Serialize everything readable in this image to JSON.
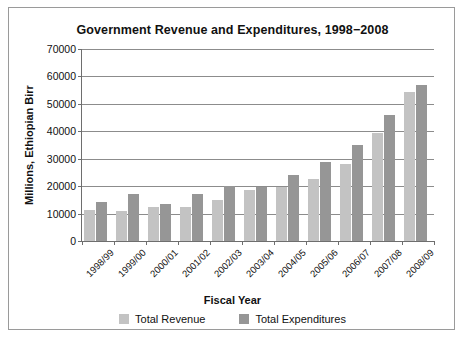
{
  "chart_data": {
    "type": "bar",
    "title": "Government Revenue and Expenditures, 1998−2008",
    "xlabel": "Fiscal Year",
    "ylabel": "Millions, Ethiopian Birr",
    "ylim": [
      0,
      70000
    ],
    "ytick_labels": [
      "70000",
      "60000",
      "50000",
      "40000",
      "30000",
      "20000",
      "10000",
      "0"
    ],
    "ytick_values": [
      70000,
      60000,
      50000,
      40000,
      30000,
      20000,
      10000,
      0
    ],
    "grid": true,
    "legend_position": "bottom",
    "categories": [
      "1998/99",
      "1999/00",
      "2000/01",
      "2001/02",
      "2002/03",
      "2003/04",
      "2004/05",
      "2005/06",
      "2006/07",
      "2007/08",
      "2008/09"
    ],
    "series": [
      {
        "name": "Total Revenue",
        "color": "#c3c3c3",
        "values": [
          11300,
          10900,
          12300,
          12500,
          15000,
          18500,
          19800,
          22600,
          28000,
          39500,
          54500
        ]
      },
      {
        "name": "Total Expenditures",
        "color": "#969696",
        "values": [
          14300,
          17000,
          13500,
          17300,
          20000,
          19800,
          24000,
          28800,
          35000,
          46000,
          56800
        ]
      }
    ]
  },
  "colors": {
    "revenue": "#c3c3c3",
    "expenditures": "#969696",
    "axis": "#6e6e6e",
    "grid": "#8c8c8c",
    "frame_border": "#9a9a9a",
    "text": "#111111",
    "background": "#ffffff"
  }
}
